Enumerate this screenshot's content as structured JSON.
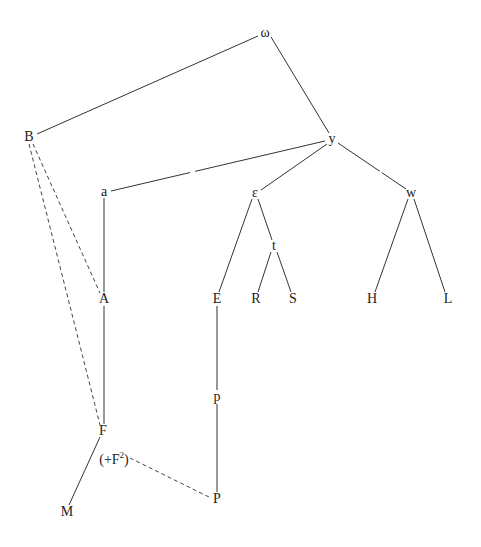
{
  "diagram": {
    "type": "tree",
    "nodes": [
      {
        "id": "omega",
        "label": "ω",
        "x": 265,
        "y": 33
      },
      {
        "id": "B",
        "label": "B",
        "x": 29,
        "y": 137
      },
      {
        "id": "y",
        "label": "y",
        "x": 332,
        "y": 139
      },
      {
        "id": "a",
        "label": "a",
        "x": 104,
        "y": 192
      },
      {
        "id": "epsilon",
        "label": "ε",
        "x": 255,
        "y": 193
      },
      {
        "id": "w",
        "label": "w",
        "x": 411,
        "y": 193
      },
      {
        "id": "t",
        "label": "t",
        "x": 274,
        "y": 246
      },
      {
        "id": "A",
        "label": "A",
        "x": 104,
        "y": 299
      },
      {
        "id": "E",
        "label": "E",
        "x": 217,
        "y": 299
      },
      {
        "id": "R",
        "label": "R",
        "x": 256,
        "y": 299
      },
      {
        "id": "S",
        "label": "S",
        "x": 293,
        "y": 299
      },
      {
        "id": "H",
        "label": "H",
        "x": 372,
        "y": 299
      },
      {
        "id": "L",
        "label": "L",
        "x": 448,
        "y": 299
      },
      {
        "id": "p",
        "label": "p",
        "x": 217,
        "y": 397
      },
      {
        "id": "F",
        "label": "F",
        "x": 103,
        "y": 431
      },
      {
        "id": "F2",
        "label": "(+F",
        "sup": "2",
        "suffix": ")",
        "x": 114,
        "y": 459
      },
      {
        "id": "P",
        "label": "P",
        "x": 217,
        "y": 499
      },
      {
        "id": "M",
        "label": "M",
        "x": 67,
        "y": 512
      }
    ],
    "edges": [
      {
        "from": "omega",
        "to": "B",
        "style": "solid"
      },
      {
        "from": "omega",
        "to": "y",
        "style": "solid"
      },
      {
        "from": "y",
        "to": "a",
        "style": "solid"
      },
      {
        "from": "y",
        "to": "epsilon",
        "style": "solid"
      },
      {
        "from": "y",
        "to": "w",
        "style": "solid"
      },
      {
        "from": "a",
        "to": "A",
        "style": "solid"
      },
      {
        "from": "A",
        "to": "F",
        "style": "solid"
      },
      {
        "from": "F",
        "to": "M",
        "style": "solid"
      },
      {
        "from": "epsilon",
        "to": "E",
        "style": "solid"
      },
      {
        "from": "epsilon",
        "to": "t",
        "style": "solid"
      },
      {
        "from": "t",
        "to": "R",
        "style": "solid"
      },
      {
        "from": "t",
        "to": "S",
        "style": "solid"
      },
      {
        "from": "w",
        "to": "H",
        "style": "solid"
      },
      {
        "from": "w",
        "to": "L",
        "style": "solid"
      },
      {
        "from": "E",
        "to": "p",
        "style": "solid"
      },
      {
        "from": "p",
        "to": "P",
        "style": "solid"
      },
      {
        "from": "B",
        "to": "A",
        "style": "dashed"
      },
      {
        "from": "B",
        "to": "F",
        "style": "dashed"
      },
      {
        "from": "F2",
        "to": "P",
        "style": "dashed"
      }
    ]
  }
}
